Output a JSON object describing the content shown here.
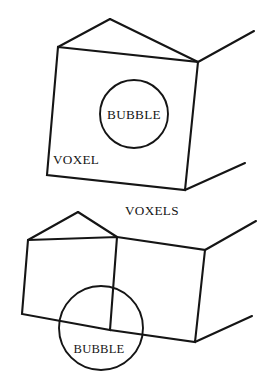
{
  "figure": {
    "background_color": "#ffffff",
    "line_color": "#151515",
    "width": 260,
    "height": 381,
    "labels": {
      "voxel": "VOXEL",
      "voxels": "VOXELS",
      "bubble_top": "BUBBLE",
      "bubble_bottom": "BUBBLE"
    },
    "panels": [
      {
        "name": "single-voxel-panel",
        "label": "VOXEL",
        "bubble_label": "BUBBLE",
        "voxel_count": 1,
        "bubble": {
          "cx": 134,
          "cy": 114,
          "r": 34,
          "contained": true
        }
      },
      {
        "name": "two-voxel-panel",
        "label": "VOXELS",
        "bubble_label": "BUBBLE",
        "voxel_count": 2,
        "bubble": {
          "cx": 101,
          "cy": 328,
          "r": 42,
          "contained": false
        }
      }
    ]
  }
}
